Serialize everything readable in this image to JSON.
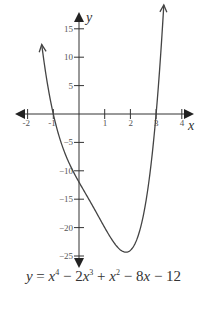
{
  "chart_data": {
    "type": "line",
    "title": "",
    "xlabel": "x",
    "ylabel": "y",
    "xlim": [
      -2,
      4
    ],
    "ylim": [
      -25,
      15
    ],
    "x_ticks": [
      -2,
      -1,
      1,
      2,
      3,
      4
    ],
    "y_ticks": [
      15,
      10,
      5,
      -5,
      -10,
      -15,
      -20,
      -25
    ],
    "grid": false,
    "legend": null,
    "series": [
      {
        "name": "y = x^4 - 2x^3 + x^2 - 8x - 12",
        "x": [
          -1.45,
          -1,
          -0.5,
          0,
          0.5,
          1,
          1.5,
          1.75,
          2,
          2.5,
          3,
          3.3
        ],
        "values": [
          13.5,
          0,
          -7.2,
          -12,
          -15.9,
          -20,
          -23.4,
          -24.0,
          -24,
          -18.4,
          0,
          15.5
        ]
      }
    ],
    "annotations": {
      "x_intercepts": [
        -1,
        3
      ],
      "y_intercept": -12,
      "minimum_approx": [
        1.8,
        -24
      ]
    },
    "equation": {
      "text": "y = x^4 − 2x^3 + x^2 − 8x − 12",
      "parts": [
        "y",
        " = ",
        "x",
        "4",
        " − 2",
        "x",
        "3",
        " + ",
        "x",
        "2",
        " − 8",
        "x",
        " − 12"
      ]
    }
  },
  "colors": {
    "axis": "#333333",
    "curve": "#444444",
    "text": "#555555",
    "background": "#ffffff"
  }
}
